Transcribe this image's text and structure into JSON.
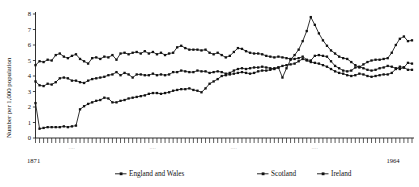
{
  "chart_data": {
    "type": "line",
    "title": "",
    "subtitle": "",
    "xlabel": "",
    "ylabel": "Number per 1,000 population",
    "xlim": [
      1871,
      1964
    ],
    "ylim": [
      0,
      8
    ],
    "yticks": [
      0,
      1,
      2,
      3,
      4,
      5,
      6,
      7,
      8
    ],
    "ytick_labels": [
      "0",
      "1",
      "2",
      "3",
      "4",
      "5",
      "6",
      "7",
      "8"
    ],
    "xtick_first_label": "1871",
    "xtick_last_label": "1964",
    "xtick_interior_labels": [
      "....",
      "....",
      "....",
      "...."
    ],
    "grid": false,
    "legend_position": "bottom-center",
    "marker": "filled-square",
    "line_color": "#111111",
    "x_start": 1871,
    "x_step": 1,
    "series": [
      {
        "name": "England and Wales",
        "values": [
          4.7,
          4.95,
          4.9,
          5.05,
          5.0,
          5.35,
          5.45,
          5.25,
          5.15,
          5.3,
          5.4,
          5.1,
          4.95,
          4.8,
          5.15,
          5.2,
          5.1,
          5.25,
          5.2,
          5.35,
          5.05,
          5.45,
          5.5,
          5.4,
          5.5,
          5.55,
          5.45,
          5.6,
          5.45,
          5.55,
          5.4,
          5.5,
          5.35,
          5.45,
          5.5,
          5.85,
          5.95,
          5.8,
          5.7,
          5.7,
          5.7,
          5.65,
          5.7,
          5.5,
          5.4,
          5.5,
          5.35,
          5.2,
          5.3,
          5.55,
          5.8,
          5.75,
          5.6,
          5.5,
          5.45,
          5.45,
          5.4,
          5.3,
          5.25,
          5.2,
          5.25,
          5.2,
          5.15,
          5.1,
          5.1,
          5.15,
          5.25,
          5.05,
          5.0,
          5.3,
          5.35,
          5.3,
          5.25,
          4.95,
          4.65,
          4.5,
          4.35,
          4.3,
          4.35,
          4.55,
          4.6,
          4.5,
          4.4,
          4.35,
          4.4,
          4.5,
          4.55,
          4.65,
          4.6,
          4.5,
          4.45,
          4.55,
          4.85,
          4.8
        ]
      },
      {
        "name": "Scotland",
        "values": [
          3.65,
          3.4,
          3.35,
          3.5,
          3.45,
          3.6,
          3.85,
          3.9,
          3.85,
          3.7,
          3.7,
          3.6,
          3.55,
          3.7,
          3.8,
          3.85,
          3.9,
          3.95,
          4.05,
          4.1,
          4.25,
          4.05,
          4.2,
          4.1,
          3.9,
          4.1,
          4.1,
          4.05,
          4.05,
          4.15,
          4.05,
          4.1,
          4.05,
          4.1,
          4.25,
          4.25,
          4.35,
          4.3,
          4.25,
          4.25,
          4.35,
          4.3,
          4.3,
          4.2,
          4.25,
          4.3,
          4.25,
          4.15,
          4.2,
          4.35,
          4.45,
          4.5,
          4.45,
          4.5,
          4.55,
          4.55,
          4.6,
          4.55,
          4.5,
          4.45,
          4.55,
          4.65,
          4.7,
          4.75,
          4.8,
          4.95,
          5.1,
          5.0,
          4.9,
          4.85,
          4.8,
          4.7,
          4.6,
          4.45,
          4.3,
          4.2,
          4.15,
          4.05,
          4.0,
          4.05,
          4.15,
          4.1,
          4.0,
          3.95,
          4.0,
          4.05,
          4.1,
          4.1,
          4.2,
          4.45,
          4.6,
          4.55,
          4.4,
          4.4
        ]
      },
      {
        "name": "Ireland",
        "values": [
          2.25,
          0.6,
          0.65,
          0.7,
          0.7,
          0.7,
          0.7,
          0.75,
          0.7,
          0.75,
          0.8,
          1.85,
          2.05,
          2.2,
          2.3,
          2.4,
          2.45,
          2.6,
          2.55,
          2.3,
          2.3,
          2.4,
          2.45,
          2.55,
          2.6,
          2.65,
          2.7,
          2.75,
          2.85,
          2.9,
          2.9,
          2.85,
          2.9,
          2.95,
          3.05,
          3.1,
          3.15,
          3.15,
          3.2,
          3.1,
          3.05,
          2.95,
          3.2,
          3.5,
          3.65,
          3.8,
          4.0,
          4.05,
          4.1,
          4.15,
          4.2,
          4.25,
          4.2,
          4.15,
          4.2,
          4.3,
          4.35,
          4.35,
          4.4,
          4.5,
          4.55,
          3.9,
          4.5,
          5.05,
          5.35,
          5.7,
          6.25,
          6.9,
          7.8,
          7.3,
          6.75,
          6.3,
          5.95,
          5.65,
          5.45,
          5.25,
          5.15,
          5.1,
          4.9,
          4.7,
          4.55,
          4.75,
          4.9,
          5.0,
          5.05,
          5.05,
          5.1,
          5.15,
          5.5,
          6.0,
          6.4,
          6.55,
          6.25,
          6.3
        ]
      }
    ]
  },
  "legend": {
    "items": [
      {
        "label": "England and Wales"
      },
      {
        "label": "Scotland"
      },
      {
        "label": "Ireland"
      }
    ]
  }
}
